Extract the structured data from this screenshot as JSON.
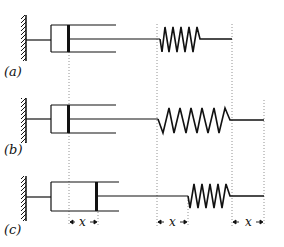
{
  "figure": {
    "panels": [
      {
        "label": "(a)",
        "state": "piston at reference, spring unstretched"
      },
      {
        "label": "(b)",
        "state": "piston at reference, spring stretched"
      },
      {
        "label": "(c)",
        "state": "piston displaced by x, spring displaced by x"
      }
    ],
    "displacement_label": "x",
    "colors": {
      "line": "#111111",
      "dotted": "#888888",
      "background": "#ffffff"
    }
  }
}
